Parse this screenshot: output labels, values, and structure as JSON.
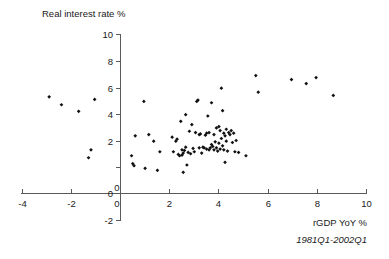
{
  "chart_data": {
    "type": "scatter",
    "title": "",
    "xlabel": "rGDP YoY %",
    "ylabel": "Real interest rate %",
    "annotation": "1981Q1-2002Q1",
    "xlim": [
      -4,
      10
    ],
    "ylim": [
      -2,
      10
    ],
    "xticks": [
      -4,
      -2,
      0,
      2,
      4,
      6,
      8,
      10
    ],
    "yticks": [
      -2,
      0,
      2,
      4,
      6,
      8,
      10
    ],
    "xtick_labels": [
      "-4",
      "-2",
      "0",
      "2",
      "4",
      "6",
      "8",
      "10"
    ],
    "ytick_labels": [
      "-2",
      "0",
      "2",
      "4",
      "6",
      "8",
      "10"
    ],
    "origin_label": "0",
    "grid": false,
    "legend": null,
    "marker": "filled-diamond",
    "marker_color": "#111111",
    "series": [
      {
        "name": "quarterly observations",
        "points": [
          [
            -2.9,
            7.3
          ],
          [
            -2.4,
            6.7
          ],
          [
            -1.7,
            6.2
          ],
          [
            -1.3,
            2.7
          ],
          [
            -1.2,
            3.3
          ],
          [
            -1.05,
            7.1
          ],
          [
            0.45,
            2.85
          ],
          [
            0.5,
            2.25
          ],
          [
            0.55,
            2.1
          ],
          [
            0.6,
            4.35
          ],
          [
            0.95,
            6.95
          ],
          [
            1.0,
            1.9
          ],
          [
            1.15,
            4.45
          ],
          [
            1.35,
            3.95
          ],
          [
            1.5,
            1.75
          ],
          [
            1.6,
            3.15
          ],
          [
            2.1,
            4.25
          ],
          [
            2.15,
            3.15
          ],
          [
            2.25,
            3.95
          ],
          [
            2.3,
            4.1
          ],
          [
            2.35,
            2.95
          ],
          [
            2.4,
            2.85
          ],
          [
            2.45,
            5.45
          ],
          [
            2.5,
            3.3
          ],
          [
            2.5,
            2.9
          ],
          [
            2.55,
            3.05
          ],
          [
            2.55,
            1.6
          ],
          [
            2.6,
            3.25
          ],
          [
            2.65,
            5.95
          ],
          [
            2.65,
            3.5
          ],
          [
            2.7,
            2.15
          ],
          [
            2.75,
            3.1
          ],
          [
            2.8,
            4.7
          ],
          [
            2.85,
            3.0
          ],
          [
            2.9,
            5.2
          ],
          [
            2.95,
            3.4
          ],
          [
            3.0,
            3.15
          ],
          [
            3.05,
            4.6
          ],
          [
            3.1,
            6.95
          ],
          [
            3.15,
            7.05
          ],
          [
            3.2,
            4.45
          ],
          [
            3.2,
            3.45
          ],
          [
            3.25,
            4.5
          ],
          [
            3.3,
            3.05
          ],
          [
            3.35,
            3.5
          ],
          [
            3.4,
            3.45
          ],
          [
            3.45,
            4.4
          ],
          [
            3.5,
            4.55
          ],
          [
            3.5,
            3.35
          ],
          [
            3.55,
            5.85
          ],
          [
            3.6,
            3.3
          ],
          [
            3.6,
            4.6
          ],
          [
            3.65,
            3.45
          ],
          [
            3.7,
            6.85
          ],
          [
            3.7,
            3.7
          ],
          [
            3.75,
            3.55
          ],
          [
            3.8,
            4.45
          ],
          [
            3.8,
            3.3
          ],
          [
            3.85,
            3.9
          ],
          [
            3.9,
            3.45
          ],
          [
            3.9,
            4.95
          ],
          [
            3.95,
            3.2
          ],
          [
            4.0,
            3.8
          ],
          [
            4.0,
            5.05
          ],
          [
            4.05,
            4.75
          ],
          [
            4.05,
            3.35
          ],
          [
            4.1,
            7.95
          ],
          [
            4.1,
            4.15
          ],
          [
            4.15,
            3.6
          ],
          [
            4.15,
            6.25
          ],
          [
            4.2,
            4.55
          ],
          [
            4.2,
            3.3
          ],
          [
            4.25,
            4.35
          ],
          [
            4.25,
            2.35
          ],
          [
            4.3,
            4.85
          ],
          [
            4.3,
            3.95
          ],
          [
            4.35,
            3.2
          ],
          [
            4.4,
            4.6
          ],
          [
            4.45,
            4.45
          ],
          [
            4.5,
            4.75
          ],
          [
            4.55,
            3.85
          ],
          [
            4.6,
            4.55
          ],
          [
            4.65,
            3.15
          ],
          [
            4.7,
            4.0
          ],
          [
            4.8,
            3.1
          ],
          [
            5.1,
            2.85
          ],
          [
            5.5,
            8.9
          ],
          [
            5.6,
            7.65
          ],
          [
            6.95,
            8.6
          ],
          [
            7.55,
            8.3
          ],
          [
            7.95,
            8.75
          ],
          [
            8.65,
            7.4
          ]
        ]
      }
    ]
  },
  "axis_titles": {
    "y_title": "Real interest rate %",
    "x_title": "rGDP YoY %",
    "note": "1981Q1-2002Q1"
  }
}
